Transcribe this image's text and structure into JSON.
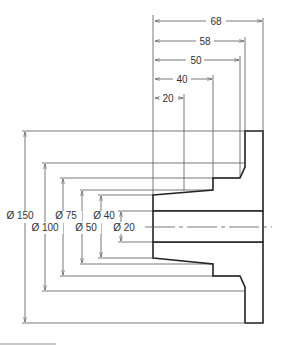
{
  "drawing": {
    "type": "flange-section-drawing",
    "units": "mm",
    "colors": {
      "line": "#222222",
      "dimension": "#555555",
      "hatch": "#444444",
      "background": "#ffffff"
    },
    "lengths": [
      {
        "label": "20",
        "value": 20
      },
      {
        "label": "40",
        "value": 40
      },
      {
        "label": "50",
        "value": 50
      },
      {
        "label": "58",
        "value": 58
      },
      {
        "label": "68",
        "value": 68
      }
    ],
    "diameters": [
      {
        "label": "Ø 150",
        "value": 150
      },
      {
        "label": "Ø 100",
        "value": 100
      },
      {
        "label": "Ø 75",
        "value": 75
      },
      {
        "label": "Ø 50",
        "value": 50
      },
      {
        "label": "Ø 40",
        "value": 40
      },
      {
        "label": "Ø 20",
        "value": 20
      }
    ]
  }
}
